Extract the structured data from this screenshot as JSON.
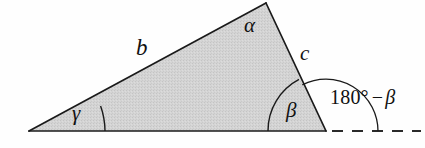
{
  "figure": {
    "name": "triangle-exterior-angle-diagram",
    "type": "geometry-diagram",
    "background_color": "#fefefe",
    "fill_color": "#d2d2d2",
    "stroke_color": "#1a1a1a"
  },
  "labels": {
    "side_b": "b",
    "side_c": "c",
    "angle_alpha": "α",
    "angle_beta": "β",
    "angle_gamma": "γ",
    "exterior_value": "180",
    "exterior_degree": "°",
    "exterior_minus": "−",
    "exterior_beta": "β"
  },
  "geometry": {
    "vertex_gamma": {
      "x": 29,
      "y": 131
    },
    "vertex_alpha": {
      "x": 266,
      "y": 3
    },
    "vertex_beta": {
      "x": 326,
      "y": 131
    },
    "dashed_ray_start": {
      "x": 332,
      "y": 131
    },
    "dashed_ray_end": {
      "x": 421,
      "y": 131
    },
    "arc_gamma_radius": 76,
    "arc_beta_radius": 58,
    "arc_exterior_radius": 52
  }
}
